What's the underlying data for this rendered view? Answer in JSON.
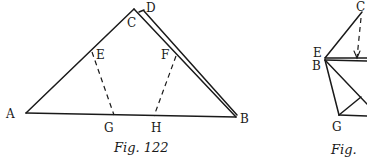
{
  "figures": [
    {
      "caption": "Fig. 122",
      "labels": {
        "A": "A",
        "B": "B",
        "C": "C",
        "D": "D",
        "E": "E",
        "F": "F",
        "G": "G",
        "H": "H"
      }
    },
    {
      "caption": "Fig.",
      "labels": {
        "C": "C",
        "E": "E",
        "B": "B",
        "G": "G"
      }
    }
  ]
}
